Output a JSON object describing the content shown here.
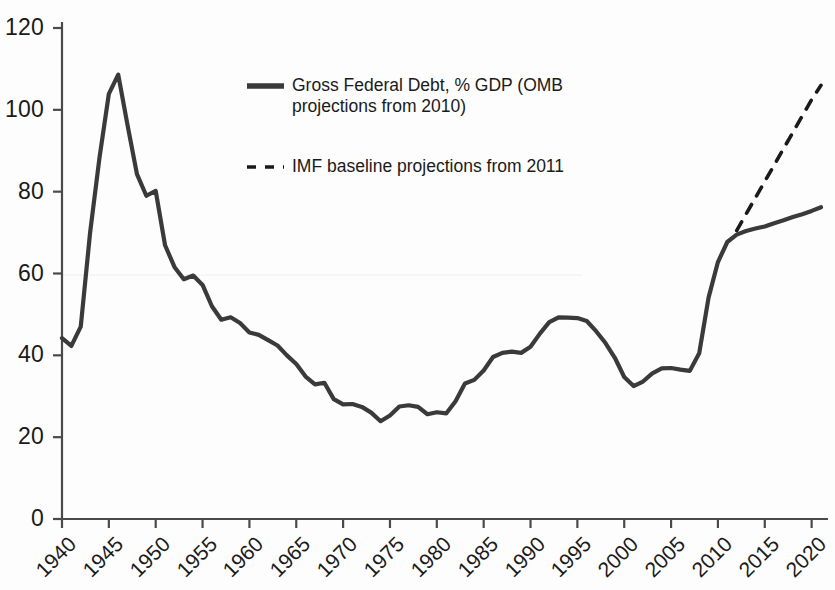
{
  "chart_data": {
    "type": "line",
    "title": "",
    "subtitle": "",
    "xlabel": "",
    "ylabel": "",
    "xlim": [
      1940,
      2021
    ],
    "ylim": [
      0,
      120
    ],
    "grid": false,
    "legend_position": "upper-center",
    "y_ticks": [
      0,
      20,
      40,
      60,
      80,
      100,
      120
    ],
    "x_ticks": [
      1940,
      1945,
      1950,
      1955,
      1960,
      1965,
      1970,
      1975,
      1980,
      1985,
      1990,
      1995,
      2000,
      2005,
      2010,
      2015,
      2020
    ],
    "y_tick_labels": [
      "0",
      "20",
      "40",
      "60",
      "80",
      "100",
      "120"
    ],
    "x_tick_labels": [
      "1940",
      "1945",
      "1950",
      "1955",
      "1960",
      "1965",
      "1970",
      "1975",
      "1980",
      "1985",
      "1990",
      "1995",
      "2000",
      "2005",
      "2010",
      "2015",
      "2020"
    ],
    "series": [
      {
        "name": "Gross Federal Debt, % GDP (OMB projections from 2010)",
        "style": "solid",
        "color": "#3a3a3a",
        "x": [
          1940,
          1941,
          1942,
          1943,
          1944,
          1945,
          1946,
          1947,
          1948,
          1949,
          1950,
          1951,
          1952,
          1953,
          1954,
          1955,
          1956,
          1957,
          1958,
          1959,
          1960,
          1961,
          1962,
          1963,
          1964,
          1965,
          1966,
          1967,
          1968,
          1969,
          1970,
          1971,
          1972,
          1973,
          1974,
          1975,
          1976,
          1977,
          1978,
          1979,
          1980,
          1981,
          1982,
          1983,
          1984,
          1985,
          1986,
          1987,
          1988,
          1989,
          1990,
          1991,
          1992,
          1993,
          1994,
          1995,
          1996,
          1997,
          1998,
          1999,
          2000,
          2001,
          2002,
          2003,
          2004,
          2005,
          2006,
          2007,
          2008,
          2009,
          2010,
          2011,
          2012,
          2013,
          2014,
          2015,
          2016,
          2017,
          2018,
          2019,
          2020,
          2021
        ],
        "values": [
          44.2,
          42.3,
          47.0,
          70.0,
          88.3,
          103.9,
          108.6,
          96.2,
          84.3,
          79.0,
          80.2,
          66.9,
          61.6,
          58.6,
          59.5,
          57.2,
          52.0,
          48.7,
          49.3,
          47.9,
          45.6,
          45.0,
          43.7,
          42.4,
          40.0,
          37.9,
          34.8,
          32.9,
          33.3,
          29.3,
          28.0,
          28.1,
          27.4,
          26.0,
          23.9,
          25.3,
          27.5,
          27.8,
          27.4,
          25.6,
          26.1,
          25.8,
          28.8,
          33.1,
          34.0,
          36.3,
          39.6,
          40.6,
          40.9,
          40.6,
          42.1,
          45.3,
          48.1,
          49.3,
          49.2,
          49.1,
          48.4,
          45.9,
          43.0,
          39.4,
          34.7,
          32.5,
          33.6,
          35.6,
          36.8,
          36.9,
          36.5,
          36.2,
          40.5,
          54.1,
          62.8,
          67.7,
          69.5,
          70.4,
          71.0,
          71.5,
          72.3,
          73.0,
          73.8,
          74.5,
          75.3,
          76.2
        ]
      },
      {
        "name": "IMF baseline projections from 2011",
        "style": "dashed",
        "color": "#1a1a1a",
        "x": [
          2012,
          2013,
          2014,
          2015,
          2016,
          2017,
          2018,
          2019,
          2020,
          2021
        ],
        "values": [
          70.5,
          74.5,
          78.5,
          82.5,
          86.5,
          90.5,
          94.5,
          98.5,
          102.5,
          106.0
        ]
      }
    ]
  },
  "legend": {
    "entries": [
      {
        "label": "Gross Federal Debt, % GDP (OMB\nprojections from 2010)",
        "style": "solid",
        "swatch_name": "legend-swatch-solid"
      },
      {
        "label": "IMF baseline projections from 2011",
        "style": "dashed",
        "swatch_name": "legend-swatch-dashed"
      }
    ]
  },
  "colors": {
    "line": "#3a3a3a",
    "axis": "#4a4a4a",
    "text": "#1a1a1a",
    "background": "#fdfdfd"
  }
}
